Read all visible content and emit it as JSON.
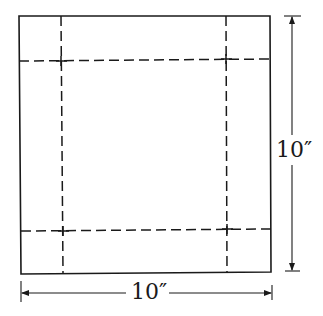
{
  "figure": {
    "stroke_color": "#1a1a1a",
    "square": {
      "width_label": "10″",
      "height_label": "10″"
    },
    "fold_lines": {
      "style": "dashed",
      "count_vertical": 2,
      "count_horizontal": 2
    },
    "dimensions": {
      "right": {
        "label": "10″",
        "orientation": "vertical"
      },
      "bottom": {
        "label": "10″",
        "orientation": "horizontal"
      }
    }
  }
}
